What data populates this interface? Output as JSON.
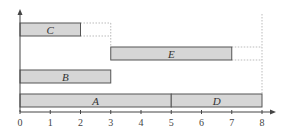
{
  "chart_data": {
    "type": "gantt",
    "title": "",
    "xlabel": "",
    "ylabel": "",
    "xlim": [
      0,
      8
    ],
    "x_ticks": [
      "0",
      "1",
      "2",
      "3",
      "4",
      "5",
      "6",
      "7",
      "8"
    ],
    "grid": false,
    "legend": null,
    "tasks": [
      {
        "name": "C",
        "start": 0,
        "end": 2,
        "row": 4
      },
      {
        "name": "E",
        "start": 3,
        "end": 7,
        "row": 3
      },
      {
        "name": "B",
        "start": 0,
        "end": 3,
        "row": 2
      },
      {
        "name": "A",
        "start": 0,
        "end": 5,
        "row": 1
      },
      {
        "name": "D",
        "start": 5,
        "end": 8,
        "row": 1
      }
    ],
    "guides": [
      {
        "from_task": "C",
        "to_x": 3,
        "style": "dotted"
      },
      {
        "from_task": "E",
        "to_x": 8,
        "style": "dotted"
      }
    ],
    "colors": {
      "bar_fill": "#d6d6d6",
      "bar_stroke": "#555555",
      "axis": "#444444",
      "guide": "#aaaaaa"
    }
  }
}
